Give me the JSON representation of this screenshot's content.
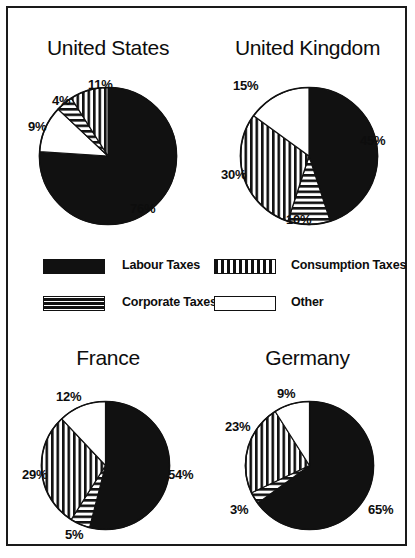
{
  "figure": {
    "border_color": "#1a1a1a",
    "background": "#ffffff"
  },
  "legend": {
    "items": [
      {
        "key": "labour",
        "label": "Labour Taxes",
        "pattern": "solid-black",
        "color": "#111111"
      },
      {
        "key": "consumption",
        "label": "Consumption Taxes",
        "pattern": "vertical-stripes",
        "color": "#111111"
      },
      {
        "key": "corporate",
        "label": "Corporate Taxes",
        "pattern": "horizontal-stripes",
        "color": "#111111"
      },
      {
        "key": "other",
        "label": "Other",
        "pattern": "open-white",
        "color": "#ffffff"
      }
    ]
  },
  "chart_data": [
    {
      "type": "pie",
      "title": "United States",
      "categories": [
        "Labour Taxes",
        "Other",
        "Corporate Taxes",
        "Consumption Taxes"
      ],
      "values": [
        76,
        11,
        4,
        9
      ],
      "labels": [
        "76%",
        "11%",
        "4%",
        "9%"
      ],
      "patterns": [
        "solid-black",
        "open-white",
        "horizontal-stripes",
        "vertical-stripes"
      ],
      "start_angle_deg": 0,
      "direction": "clockwise",
      "legend_position": "center"
    },
    {
      "type": "pie",
      "title": "United Kingdom",
      "categories": [
        "Labour Taxes",
        "Corporate Taxes",
        "Consumption Taxes",
        "Other"
      ],
      "values": [
        45,
        10,
        30,
        15
      ],
      "labels": [
        "45%",
        "10%",
        "30%",
        "15%"
      ],
      "patterns": [
        "solid-black",
        "horizontal-stripes",
        "vertical-stripes",
        "open-white"
      ],
      "start_angle_deg": 0,
      "direction": "clockwise",
      "legend_position": "center"
    },
    {
      "type": "pie",
      "title": "France",
      "categories": [
        "Labour Taxes",
        "Corporate Taxes",
        "Consumption Taxes",
        "Other"
      ],
      "values": [
        54,
        5,
        29,
        12
      ],
      "labels": [
        "54%",
        "5%",
        "29%",
        "12%"
      ],
      "patterns": [
        "solid-black",
        "horizontal-stripes",
        "vertical-stripes",
        "open-white"
      ],
      "start_angle_deg": 0,
      "direction": "clockwise",
      "legend_position": "center"
    },
    {
      "type": "pie",
      "title": "Germany",
      "categories": [
        "Labour Taxes",
        "Corporate Taxes",
        "Consumption Taxes",
        "Other"
      ],
      "values": [
        65,
        3,
        23,
        9
      ],
      "labels": [
        "65%",
        "3%",
        "23%",
        "9%"
      ],
      "patterns": [
        "solid-black",
        "horizontal-stripes",
        "vertical-stripes",
        "open-white"
      ],
      "start_angle_deg": 0,
      "direction": "clockwise",
      "legend_position": "center"
    }
  ],
  "caption": ""
}
